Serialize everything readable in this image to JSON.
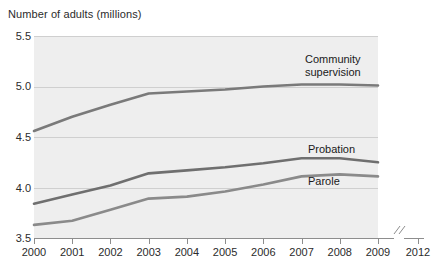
{
  "chart_data": {
    "type": "line",
    "title": "",
    "ylabel": "Number of adults (millions)",
    "xlabel": "",
    "x": [
      2000,
      2001,
      2002,
      2003,
      2004,
      2005,
      2006,
      2007,
      2008,
      2009
    ],
    "xtick_labels": [
      "2000",
      "2001",
      "2002",
      "2003",
      "2004",
      "2005",
      "2006",
      "2007",
      "2008",
      "2009",
      "2012"
    ],
    "ytick_labels": [
      "5.5",
      "5.0",
      "4.5",
      "4.0",
      "3.5"
    ],
    "yticks": [
      5.5,
      5.0,
      4.5,
      4.0,
      3.5
    ],
    "ylim": [
      3.5,
      5.5
    ],
    "xlim": [
      2000,
      2009
    ],
    "axis_break": true,
    "axis_break_note": "//",
    "grid": "horizontal",
    "legend_position": "inline-callout",
    "series": [
      {
        "name": "Community supervision",
        "label": "Community\nsupervision",
        "color": "#7a7a7a",
        "values": [
          4.56,
          4.7,
          4.82,
          4.93,
          4.95,
          4.97,
          5.0,
          5.02,
          5.02,
          5.01
        ]
      },
      {
        "name": "Probation",
        "label": "Probation",
        "color": "#6f6f6f",
        "values": [
          3.84,
          3.93,
          4.02,
          4.14,
          4.17,
          4.2,
          4.24,
          4.29,
          4.29,
          4.25
        ]
      },
      {
        "name": "Parole",
        "label": "Parole",
        "color": "#8a8a8a",
        "values": [
          3.63,
          3.67,
          3.78,
          3.89,
          3.91,
          3.96,
          4.03,
          4.11,
          4.13,
          4.11
        ]
      }
    ],
    "colors": {
      "panel_background": "#eeeeee",
      "gridline": "#cfcfcf",
      "axis": "#8d8d8d",
      "text": "#231f20"
    }
  }
}
